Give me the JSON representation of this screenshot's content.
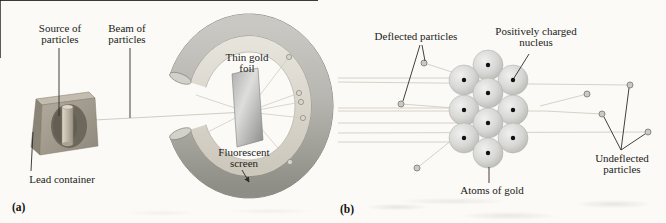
{
  "panels": {
    "a": {
      "tag": "(a)",
      "labels": {
        "source_of_particles": "Source of particles",
        "beam_of_particles": "Beam of particles",
        "thin_gold_foil": "Thin gold foil",
        "fluorescent_screen": "Fluorescent screen",
        "lead_container": "Lead container"
      }
    },
    "b": {
      "tag": "(b)",
      "labels": {
        "deflected_particles": "Deflected particles",
        "positively_charged_nucleus": "Positively charged nucleus",
        "atoms_of_gold": "Atoms of gold",
        "undeflected_particles": "Undeflected particles"
      }
    }
  },
  "colors": {
    "background": "#fbfaf6",
    "ray": "#d2cdc2",
    "flash_fill": "#d9d6cd",
    "flash_edge": "#8f8d83",
    "atom_edge": "#abaaa6",
    "nucleus": "#111111",
    "particle_fill": "#cbc9c3",
    "particle_edge": "#8b897f",
    "pointer": "#2b2b2b",
    "ring_band_dark": "#8f8e86",
    "ring_face_light": "#e6e3db"
  },
  "diagram_data": {
    "panel_a": {
      "beam_path": [
        [
          75,
          121
        ],
        [
          246,
          112
        ]
      ],
      "scatter_rays": [
        [
          [
            247,
            112
          ],
          [
            289,
            57
          ]
        ],
        [
          [
            247,
            112
          ],
          [
            299,
            93
          ]
        ],
        [
          [
            247,
            112
          ],
          [
            301,
            102
          ]
        ],
        [
          [
            247,
            112
          ],
          [
            303,
            118
          ]
        ],
        [
          [
            247,
            112
          ],
          [
            290,
            162
          ]
        ],
        [
          [
            247,
            112
          ],
          [
            196,
            95
          ]
        ],
        [
          [
            247,
            112
          ],
          [
            196,
            138
          ]
        ]
      ],
      "screen_flashes": [
        [
          289,
          57
        ],
        [
          299,
          93
        ],
        [
          301,
          102
        ],
        [
          303,
          118
        ],
        [
          290,
          162
        ]
      ]
    },
    "panel_b": {
      "atom_radius": 15,
      "atoms": [
        [
          488,
          65
        ],
        [
          464,
          80
        ],
        [
          513,
          80
        ],
        [
          488,
          93
        ],
        [
          464,
          110
        ],
        [
          513,
          110
        ],
        [
          488,
          123
        ],
        [
          464,
          138
        ],
        [
          513,
          138
        ],
        [
          488,
          153
        ]
      ],
      "rays": [
        [
          [
            338,
            78
          ],
          [
            490,
            78
          ]
        ],
        [
          [
            338,
            82
          ],
          [
            630,
            85
          ]
        ],
        [
          [
            338,
            108
          ],
          [
            455,
            108
          ]
        ],
        [
          [
            338,
            111
          ],
          [
            545,
            111
          ],
          [
            602,
            114
          ]
        ],
        [
          [
            338,
            123
          ],
          [
            490,
            123
          ]
        ],
        [
          [
            338,
            133
          ],
          [
            648,
            132
          ]
        ],
        [
          [
            338,
            142
          ],
          [
            480,
            142
          ]
        ],
        [
          [
            458,
            74
          ],
          [
            424,
            63
          ]
        ],
        [
          [
            455,
            108
          ],
          [
            401,
            104
          ]
        ],
        [
          [
            452,
            140
          ],
          [
            417,
            168
          ]
        ],
        [
          [
            540,
            106
          ],
          [
            587,
            94
          ]
        ]
      ],
      "particles": [
        [
          424,
          63
        ],
        [
          401,
          104
        ],
        [
          417,
          168
        ],
        [
          587,
          94
        ],
        [
          602,
          114
        ],
        [
          630,
          85
        ],
        [
          648,
          132
        ]
      ]
    }
  }
}
